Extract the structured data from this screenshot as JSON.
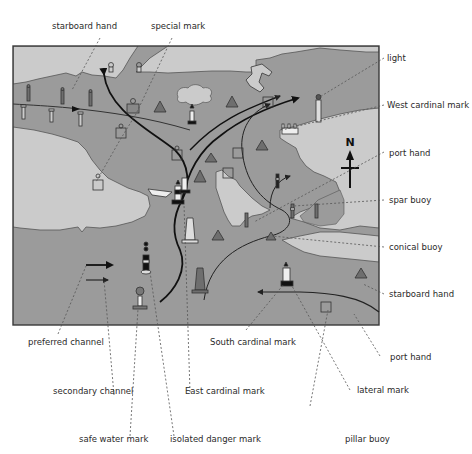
{
  "diagram": {
    "type": "nautical chart with buoyage symbols",
    "colors": {
      "water": "#9b9b9b",
      "land": "#cbcbcb",
      "frame": "#3a3a3a",
      "route": "#111111",
      "leader": "#555555",
      "buoy_fill": "#6e6e6e"
    },
    "compass": {
      "label": "N"
    },
    "labels": {
      "starboard_hand_top": "starboard hand",
      "special_mark": "special mark",
      "light": "light",
      "west_cardinal_mark": "West cardinal mark",
      "port_hand_right": "port hand",
      "spar_buoy": "spar buoy",
      "conical_buoy": "conical buoy",
      "starboard_hand_right": "starboard hand",
      "port_hand_bottom": "port hand",
      "preferred_channel": "preferred channel",
      "south_cardinal_mark": "South cardinal mark",
      "lateral_mark": "lateral mark",
      "secondary_channel": "secondary channel",
      "east_cardinal_mark": "East cardinal mark",
      "safe_water_mark": "safe water mark",
      "isolated_danger_mark": "isolated danger mark",
      "pillar_buoy": "pillar buoy"
    }
  }
}
